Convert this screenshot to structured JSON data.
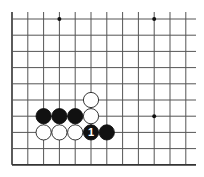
{
  "diagram": {
    "type": "go-board-fragment",
    "grid": {
      "origin_x": 12,
      "origin_y": 19,
      "spacing_x": 15.8,
      "spacing_y": 16.2,
      "columns": 12,
      "rows": 10,
      "line_extend_right": 196,
      "line_color": "#555555",
      "border_color": "#333333"
    },
    "star_points": [
      {
        "col": 3,
        "row": 0
      },
      {
        "col": 9,
        "row": 0
      },
      {
        "col": 9,
        "row": 6
      }
    ],
    "stones": [
      {
        "color": "white",
        "col": 5,
        "row": 5,
        "label": ""
      },
      {
        "color": "white",
        "col": 5,
        "row": 6,
        "label": ""
      },
      {
        "color": "black",
        "col": 2,
        "row": 6,
        "label": ""
      },
      {
        "color": "black",
        "col": 3,
        "row": 6,
        "label": ""
      },
      {
        "color": "black",
        "col": 4,
        "row": 6,
        "label": ""
      },
      {
        "color": "white",
        "col": 2,
        "row": 7,
        "label": ""
      },
      {
        "color": "white",
        "col": 3,
        "row": 7,
        "label": ""
      },
      {
        "color": "white",
        "col": 4,
        "row": 7,
        "label": ""
      },
      {
        "color": "black",
        "col": 5,
        "row": 7,
        "label": "1"
      },
      {
        "color": "black",
        "col": 6,
        "row": 7,
        "label": ""
      }
    ],
    "colors": {
      "black_stone": "#111111",
      "white_stone": "#ffffff",
      "white_stone_stroke": "#222222",
      "label_on_black": "#ffffff"
    }
  }
}
